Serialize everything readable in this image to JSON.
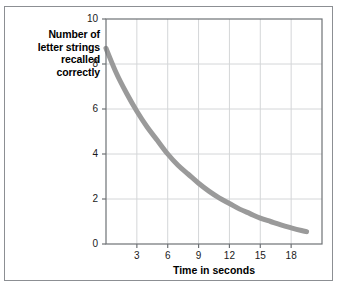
{
  "chart_data": {
    "type": "line",
    "title": "",
    "xlabel": "Time in seconds",
    "ylabel": "Number of letter strings recalled correctly",
    "ylabel_lines": [
      "Number of",
      "letter strings",
      "recalled",
      "correctly"
    ],
    "xlim": [
      0,
      21
    ],
    "ylim": [
      0,
      10
    ],
    "xticks": [
      3,
      6,
      9,
      12,
      15,
      18
    ],
    "yticks": [
      0,
      2,
      4,
      6,
      8,
      10
    ],
    "xtick_labels": [
      "3",
      "6",
      "9",
      "12",
      "15",
      "18"
    ],
    "ytick_labels": [
      "0",
      "2",
      "4",
      "6",
      "8",
      "10"
    ],
    "grid": true,
    "legend": "none",
    "series": [
      {
        "name": "recall decay",
        "color": "#9a9a9a",
        "linewidth": 5,
        "x": [
          0,
          1,
          2,
          3,
          4,
          5,
          6,
          7,
          8,
          9,
          10,
          11,
          12,
          13,
          14,
          15,
          16,
          17,
          18,
          19,
          19.5
        ],
        "y": [
          8.7,
          7.6,
          6.7,
          5.9,
          5.2,
          4.6,
          4.0,
          3.5,
          3.1,
          2.7,
          2.35,
          2.05,
          1.8,
          1.55,
          1.35,
          1.15,
          1.0,
          0.85,
          0.72,
          0.6,
          0.55
        ]
      }
    ]
  },
  "figure": {
    "border_color": "#8c8f93",
    "background": "#ffffff",
    "axis_color": "#6e7276",
    "grid_color": "#d4d6d8",
    "curve_color": "#9a9a9a"
  }
}
